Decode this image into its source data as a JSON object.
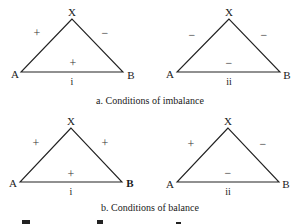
{
  "diagram": {
    "sections": [
      {
        "caption": "a.  Conditions of imbalance",
        "triangles": [
          {
            "numeral": "i",
            "vertices": {
              "top": "X",
              "left": "A",
              "right": "B"
            },
            "signs": {
              "left_side": "+",
              "right_side": "−",
              "base": "+"
            }
          },
          {
            "numeral": "ii",
            "vertices": {
              "top": "X",
              "left": "A",
              "right": "B"
            },
            "signs": {
              "left_side": "−",
              "right_side": "−",
              "base": "−"
            }
          }
        ]
      },
      {
        "caption": "b.  Conditions of balance",
        "triangles": [
          {
            "numeral": "i",
            "vertices": {
              "top": "X",
              "left": "A",
              "right": "B"
            },
            "signs": {
              "left_side": "+",
              "right_side": "+",
              "base": "+"
            }
          },
          {
            "numeral": "ii",
            "vertices": {
              "top": "X",
              "left": "A",
              "right": "B"
            },
            "signs": {
              "left_side": "+",
              "right_side": "−",
              "base": "−"
            }
          }
        ]
      }
    ]
  }
}
